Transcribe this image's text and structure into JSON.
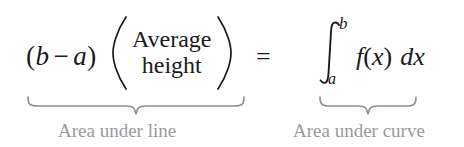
{
  "equation": {
    "left_side": {
      "factor": {
        "open_paren": "(",
        "var1": "b",
        "minus": "−",
        "var2": "a",
        "close_paren": ")"
      },
      "quantity": {
        "open_paren": "(",
        "line1": "Average",
        "line2": "height",
        "close_paren": ")"
      }
    },
    "relation": "=",
    "right_side": {
      "integral_symbol": "∫",
      "upper_limit": "b",
      "lower_limit": "a",
      "integrand": {
        "function": "f",
        "open_paren": "(",
        "variable": "x",
        "close_paren": ")",
        "differential": "dx"
      }
    }
  },
  "annotations": {
    "left_brace_label": "Area under line",
    "right_brace_label": "Area under curve"
  },
  "colors": {
    "background": "#ffffff",
    "equation_text": "#1b1b1b",
    "annotation_text": "#9a9a9d",
    "brace_stroke": "#8f8f92"
  }
}
